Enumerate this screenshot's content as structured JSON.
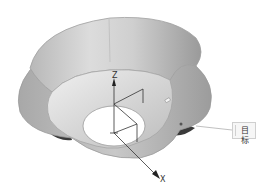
{
  "viewport": {
    "model": "flower-shaped funnel surface",
    "background": "#ffffff"
  },
  "axes": {
    "z_label": "Z",
    "x_label": "X"
  },
  "callout": {
    "label": "目标"
  },
  "colors": {
    "surface_light": "#e8e8e8",
    "surface_mid": "#c4c4c4",
    "surface_dark": "#8a8a8a",
    "edge": "#9a9a9a",
    "axis": "#222222"
  }
}
